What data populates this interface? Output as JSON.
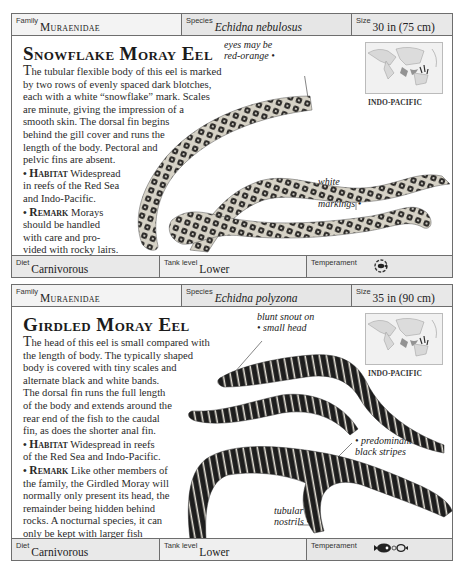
{
  "cards": [
    {
      "header": {
        "family_label": "Family",
        "family_value": "Muraenidae",
        "species_label": "Species",
        "species_value": "Echidna nebulosus",
        "size_label": "Size",
        "size_value": "30 in (75 cm)"
      },
      "title": "Snowflake Moray Eel",
      "description": {
        "dropcap": "T",
        "lines": [
          "he tubular flexible body of this eel is marked",
          "by two rows of evenly spaced dark blotches,",
          "each with a white “snowflake” mark. Scales",
          "are minute, giving the impression of a",
          "smooth skin. The dorsal fin begins",
          "behind the gill cover and runs the",
          "length of the body. Pectoral and",
          "pelvic fins are absent."
        ]
      },
      "habitat": {
        "label": "Habitat",
        "lines": [
          "Widespread",
          "in reefs of the Red Sea",
          "and Indo-Pacific."
        ]
      },
      "remark": {
        "label": "Remark",
        "lines": [
          "Morays",
          "should be handled",
          "with care and pro-",
          "vided with rocky lairs."
        ]
      },
      "map": {
        "region": "INDO-PACIFIC",
        "icon": "world-map-indo-pacific"
      },
      "annotations": [
        {
          "lines": [
            "eyes may be",
            "red-orange"
          ]
        },
        {
          "lines": [
            "white",
            "“snowflake”",
            "markings"
          ]
        }
      ],
      "footer": {
        "diet_label": "Diet",
        "diet_value": "Carnivorous",
        "tank_label": "Tank level",
        "tank_value": "Lower",
        "temperament_label": "Temperament",
        "temperament_icon": "single-fish-circle-icon"
      },
      "colors": {
        "eel_body": "#d9d6cc",
        "eel_spots": "#2a2826"
      }
    },
    {
      "header": {
        "family_label": "Family",
        "family_value": "Muraenidae",
        "species_label": "Species",
        "species_value": "Echidna polyzona",
        "size_label": "Size",
        "size_value": "35 in (90 cm)"
      },
      "title": "Girdled Moray Eel",
      "description": {
        "dropcap": "T",
        "lines": [
          "he head of this eel is small compared with",
          "the length of body. The typically shaped",
          "body is covered with tiny scales and",
          "alternate black and white bands.",
          "The dorsal fin runs the full length",
          "of the body and extends around the",
          "rear end of the fish to the caudal",
          "fin, as does the shorter anal fin."
        ]
      },
      "habitat": {
        "label": "Habitat",
        "lines": [
          "Widespread in reefs",
          "of the Red Sea and Indo-Pacific."
        ]
      },
      "remark": {
        "label": "Remark",
        "lines": [
          "Like other members of",
          "the family, the Girdled Moray will",
          "normally only present its head, the",
          "remainder being hidden behind",
          "rocks. A nocturnal species, it can",
          "only be kept with larger fish",
          "in a large covered aquarium."
        ]
      },
      "map": {
        "region": "INDO-PACIFIC",
        "icon": "world-map-indo-pacific"
      },
      "annotations": [
        {
          "lines": [
            "blunt snout on",
            "small head"
          ]
        },
        {
          "lines": [
            "predominant",
            "black stripes"
          ]
        },
        {
          "lines": [
            "tubular",
            "nostrils"
          ]
        }
      ],
      "footer": {
        "diet_label": "Diet",
        "diet_value": "Carnivorous",
        "tank_label": "Tank level",
        "tank_value": "Lower",
        "temperament_label": "Temperament",
        "temperament_icon": "large-fish-with-small-fish-icon"
      },
      "colors": {
        "eel_body": "#1c1c1c",
        "eel_bands": "#e8e4da"
      }
    }
  ]
}
